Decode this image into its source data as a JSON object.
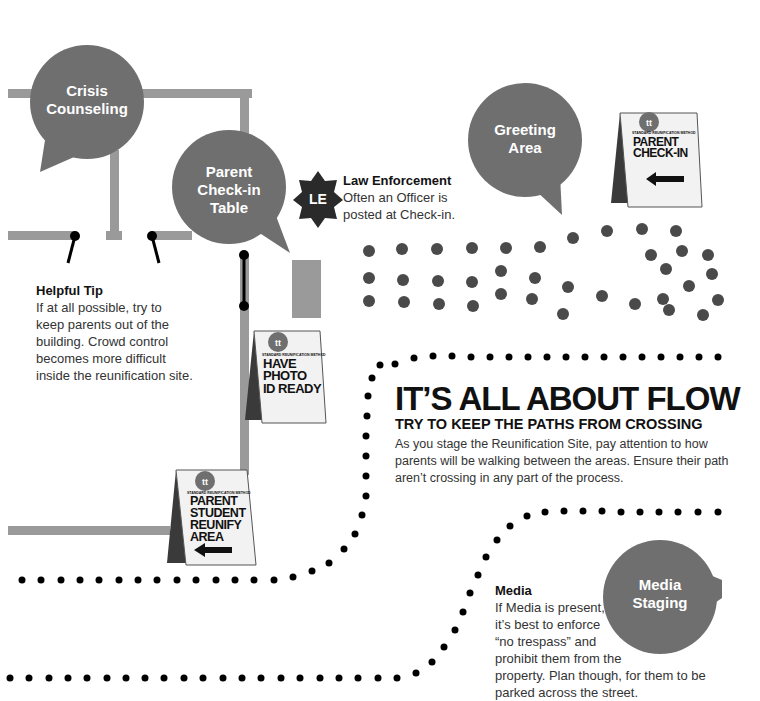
{
  "colors": {
    "bubble": "#6f6f6f",
    "path_line": "#9a9a9a",
    "sign_panel": "#f2f2f2",
    "sign_shadow": "#3a3a3a",
    "dot_crowd": "#4a4a4a",
    "dot_path": "#000000",
    "badge": "#2a2a2a"
  },
  "bubbles": {
    "crisis": {
      "line1": "Crisis",
      "line2": "Counseling"
    },
    "checkin": {
      "line1": "Parent",
      "line2": "Check-in",
      "line3": "Table"
    },
    "greeting": {
      "line1": "Greeting",
      "line2": "Area"
    },
    "media": {
      "line1": "Media",
      "line2": "Staging"
    }
  },
  "law_enforcement": {
    "badge": "LE",
    "title": "Law Enforcement",
    "body": "Often an Officer is\nposted at Check-in."
  },
  "helpful_tip": {
    "title": "Helpful Tip",
    "body": "If at all possible, try to\nkeep parents out of the\nbuilding. Crowd control\nbecomes more difficult\ninside the reunification site."
  },
  "flow": {
    "headline": "IT’S ALL ABOUT FLOW",
    "subheadline": "TRY TO KEEP THE PATHS FROM CROSSING",
    "body": "As you stage the Reunification Site, pay attention to how\nparents will be walking between the areas. Ensure their path\naren’t crossing in any part of the process."
  },
  "media_note": {
    "title": "Media",
    "body": "If Media is present,\nit’s best to enforce\n“no trespass” and\nprohibit them from the\nproperty. Plan though, for them to be\nparked across the street."
  },
  "signs": {
    "brand": "STANDARD REUNIFICATION METHOD",
    "checkin": {
      "text": "PARENT\nCHECK-IN",
      "arrow": "left-arrow"
    },
    "photo_id": {
      "text": "HAVE\nPHOTO\nID READY"
    },
    "reunify": {
      "text": "PARENT\nSTUDENT\nREUNIFY\nAREA",
      "arrow": "left-arrow"
    }
  }
}
